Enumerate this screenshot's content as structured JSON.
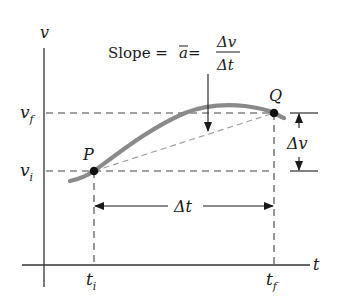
{
  "figure": {
    "type": "velocity-time graph",
    "axes": {
      "y_label": "v",
      "x_label": "t"
    },
    "title_formula": {
      "prefix": "Slope = ",
      "abar": "a",
      "equals": " = ",
      "numerator": "Δv",
      "denominator": "Δt"
    },
    "points": [
      {
        "label": "P",
        "time_label": "t",
        "time_sub": "i",
        "vel_label": "v",
        "vel_sub": "i"
      },
      {
        "label": "Q",
        "time_label": "t",
        "time_sub": "f",
        "vel_label": "v",
        "vel_sub": "f"
      }
    ],
    "intervals": {
      "delta_t": "Δt",
      "delta_v": "Δv"
    },
    "colors": {
      "curve": "#8a8a8a",
      "axes": "#333333",
      "dashed": "#444444",
      "secant": "#9a9a9a",
      "points": "#111111"
    }
  }
}
